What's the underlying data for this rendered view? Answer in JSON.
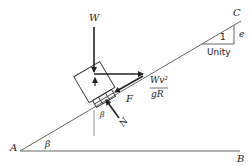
{
  "diagram": {
    "points": {
      "A": "A",
      "B": "B",
      "C": "C"
    },
    "angle_labels": {
      "incline_at_A": "β",
      "normal_tilt": "β"
    },
    "forces": {
      "weight": "W",
      "friction": "F",
      "normal": "N",
      "centrifugal_numerator": "Wv²",
      "centrifugal_denominator": "gR"
    },
    "slope_triangle": {
      "hypotenuse_label": "1",
      "vertical_label": "e",
      "base_label": "Unity"
    }
  }
}
